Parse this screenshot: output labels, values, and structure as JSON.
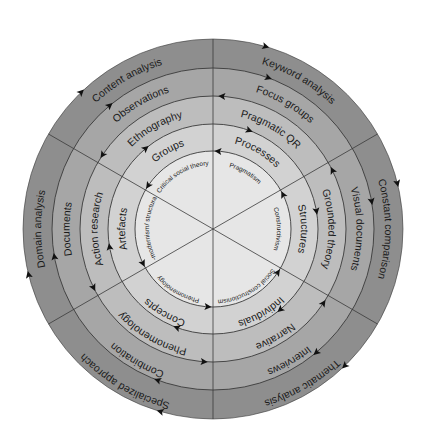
{
  "diagram": {
    "type": "concentric-circle",
    "center": [
      213,
      229
    ],
    "ring_radii": [
      190,
      161,
      133,
      105,
      78
    ],
    "ring_colors": [
      "#8e8e8e",
      "#a6a6a6",
      "#bdbdbd",
      "#d2d2d2",
      "#e6e6e6"
    ],
    "divider_angles_deg": [
      -90,
      -30,
      30,
      90,
      150,
      210
    ],
    "line_color": "#3a3a3a",
    "sectors": [
      {
        "name": "top-left",
        "mid_angle": -120,
        "labels": [
          "Content analysis",
          "Observations",
          "Ethnography",
          "Groups",
          "Critical social theory"
        ]
      },
      {
        "name": "top-right",
        "mid_angle": -60,
        "labels": [
          "Keyword analysis",
          "Focus groups",
          "Pragmatic QR",
          "Processes",
          "Pragmatism"
        ]
      },
      {
        "name": "right",
        "mid_angle": 0,
        "labels": [
          "Constant comparison",
          "Visual documents",
          "Grounded theory",
          "Structures",
          "Constructivism"
        ]
      },
      {
        "name": "bottom-right",
        "mid_angle": 60,
        "labels": [
          "Thematic analysis",
          "Interviews",
          "Narrative",
          "Individuals",
          "Social constructionism"
        ]
      },
      {
        "name": "bottom-left",
        "mid_angle": 120,
        "labels": [
          "Specialized approach",
          "Combination",
          "Phenomenology",
          "Concepts",
          "Phenomenology"
        ]
      },
      {
        "name": "left",
        "mid_angle": 180,
        "labels": [
          "Domain analysis",
          "Documents",
          "Action research",
          "Artefacts",
          "Post-modernism/ structuralism"
        ]
      }
    ]
  }
}
